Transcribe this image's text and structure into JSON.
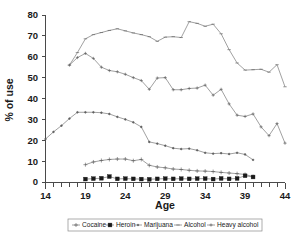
{
  "chart_data": {
    "type": "line",
    "title": "",
    "xlabel": "Age",
    "ylabel": "% of use",
    "xlim": [
      14,
      44
    ],
    "ylim": [
      0,
      80
    ],
    "xticks": [
      14,
      19,
      24,
      29,
      34,
      39,
      44
    ],
    "xtick_labels": [
      "14",
      "19",
      "24",
      "29",
      "34",
      "39",
      "44"
    ],
    "yticks": [
      0,
      10,
      20,
      30,
      40,
      50,
      60,
      70,
      80
    ],
    "ytick_labels": [
      "0",
      "10",
      "20",
      "30",
      "40",
      "50",
      "60",
      "70",
      "80"
    ],
    "x_minor_tick_step": 1,
    "grid": false,
    "legend_position": "below-axes",
    "legend": [
      "Cocaine",
      "Heroin",
      "Marijuana",
      "Alcohol",
      "Heavy alcohol"
    ],
    "series": [
      {
        "name": "Cocaine",
        "marker": "plus",
        "x": [
          19,
          20,
          21,
          22,
          23,
          24,
          25,
          26,
          27,
          28,
          29,
          30,
          31,
          32,
          33,
          34,
          35,
          36,
          37,
          38,
          39,
          40
        ],
        "values": [
          8.3,
          9.6,
          10.3,
          10.8,
          11.0,
          11.0,
          10.2,
          10.8,
          8.0,
          7.2,
          6.8,
          6.2,
          6.0,
          5.6,
          5.3,
          5.2,
          5.0,
          4.6,
          4.3,
          4.0,
          3.6,
          2.6
        ]
      },
      {
        "name": "Heroin",
        "marker": "filled-square",
        "x": [
          19,
          20,
          21,
          22,
          23,
          24,
          25,
          26,
          27,
          28,
          29,
          30,
          31,
          32,
          33,
          34,
          35,
          36,
          37,
          38,
          39,
          40
        ],
        "values": [
          1.4,
          1.6,
          1.8,
          2.6,
          1.5,
          1.6,
          1.5,
          1.4,
          1.3,
          1.5,
          1.6,
          1.5,
          1.6,
          1.5,
          1.6,
          1.6,
          1.4,
          1.7,
          1.5,
          1.7,
          3.0,
          2.4
        ]
      },
      {
        "name": "Marijuana",
        "marker": "dot",
        "x": [
          14,
          15,
          16,
          17,
          18,
          19,
          20,
          21,
          22,
          23,
          24,
          25,
          26,
          27,
          28,
          29,
          30,
          31,
          32,
          33,
          34,
          35,
          36,
          37,
          38,
          39,
          40
        ],
        "values": [
          20.6,
          24.0,
          27.0,
          30.4,
          33.4,
          33.4,
          33.4,
          33.2,
          32.6,
          31.2,
          30.0,
          28.6,
          26.4,
          19.2,
          18.4,
          17.4,
          16.2,
          15.8,
          16.0,
          15.2,
          14.0,
          13.6,
          13.8,
          13.4,
          14.0,
          13.2,
          10.6
        ]
      },
      {
        "name": "Alcohol",
        "marker": "dash",
        "x": [
          17,
          18,
          19,
          20,
          21,
          22,
          23,
          24,
          25,
          26,
          27,
          28,
          29,
          30,
          31,
          32,
          33,
          34,
          35,
          36,
          37,
          38,
          39,
          40,
          41,
          42,
          43,
          44
        ],
        "values": [
          56.0,
          62.0,
          68.6,
          70.6,
          71.6,
          72.6,
          73.4,
          72.4,
          71.4,
          70.6,
          69.6,
          67.4,
          69.4,
          69.6,
          69.2,
          76.8,
          76.0,
          74.6,
          75.6,
          71.0,
          63.4,
          57.0,
          53.6,
          53.8,
          54.0,
          52.6,
          56.2,
          45.6
        ]
      },
      {
        "name": "Heavy alcohol",
        "marker": "plus-small",
        "x": [
          17,
          18,
          19,
          20,
          21,
          22,
          23,
          24,
          25,
          26,
          27,
          28,
          29,
          30,
          31,
          32,
          33,
          34,
          35,
          36,
          37,
          38,
          39,
          40,
          41,
          42,
          43,
          44
        ],
        "values": [
          56.0,
          59.6,
          61.6,
          59.2,
          55.0,
          53.4,
          52.8,
          51.6,
          50.0,
          48.6,
          44.4,
          49.8,
          50.0,
          44.2,
          44.2,
          44.8,
          45.0,
          46.4,
          41.6,
          44.4,
          37.4,
          32.0,
          31.4,
          32.6,
          26.4,
          22.2,
          28.0,
          18.6
        ]
      }
    ]
  }
}
